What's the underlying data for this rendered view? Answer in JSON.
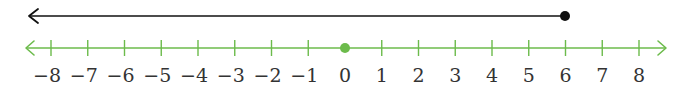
{
  "figure": {
    "colors": {
      "ray": "#111111",
      "axis": "#6cbb4b",
      "background": "#ffffff",
      "label": "#333333"
    }
  },
  "ray": {
    "endpoint": 6,
    "endpoint_style": "closed",
    "direction": "left"
  },
  "number_line": {
    "min": -8,
    "max": 8,
    "step": 1,
    "arrows": "both",
    "marked_point": 0,
    "ticks": [
      "−8",
      "−7",
      "−6",
      "−5",
      "−4",
      "−3",
      "−2",
      "−1",
      "0",
      "1",
      "2",
      "3",
      "4",
      "5",
      "6",
      "7",
      "8"
    ]
  },
  "chart_data": {
    "type": "number_line",
    "title": "",
    "xlim": [
      -8,
      8
    ],
    "tick_values": [
      -8,
      -7,
      -6,
      -5,
      -4,
      -3,
      -2,
      -1,
      0,
      1,
      2,
      3,
      4,
      5,
      6,
      7,
      8
    ],
    "tick_labels": [
      "−8",
      "−7",
      "−6",
      "−5",
      "−4",
      "−3",
      "−2",
      "−1",
      "0",
      "1",
      "2",
      "3",
      "4",
      "5",
      "6",
      "7",
      "8"
    ],
    "series": [
      {
        "name": "ray",
        "kind": "ray",
        "from": 6,
        "to": "-infinity",
        "endpoint": "closed",
        "color": "#111111",
        "represents": "x ≤ 6"
      },
      {
        "name": "point",
        "kind": "point",
        "x": 0,
        "color": "#6cbb4b"
      }
    ]
  }
}
